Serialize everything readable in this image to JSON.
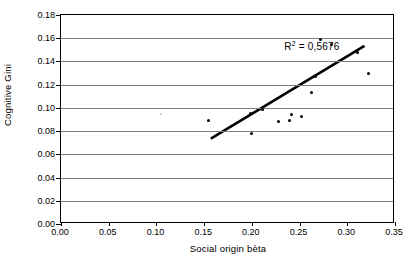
{
  "chart_data": {
    "type": "scatter",
    "title": "",
    "xlabel": "Social origin bèta",
    "ylabel": "Cognitive Gini",
    "xlim": [
      0.0,
      0.35
    ],
    "ylim": [
      0.0,
      0.18
    ],
    "xticks": [
      "0.00",
      "0.05",
      "0.10",
      "0.15",
      "0.20",
      "0.25",
      "0.30",
      "0.35"
    ],
    "xtick_values": [
      0.0,
      0.05,
      0.1,
      0.15,
      0.2,
      0.25,
      0.3,
      0.35
    ],
    "yticks": [
      "0.00",
      "0.02",
      "0.04",
      "0.06",
      "0.08",
      "0.10",
      "0.12",
      "0.14",
      "0.16",
      "0.18"
    ],
    "ytick_values": [
      0.0,
      0.02,
      0.04,
      0.06,
      0.08,
      0.1,
      0.12,
      0.14,
      0.16,
      0.18
    ],
    "grid": "horizontal",
    "legend": "none",
    "annotations": [
      {
        "name": "r-squared",
        "prefix": "R",
        "superscript": "2",
        "equals": "=",
        "value": "0,5676",
        "x": 0.235,
        "y": 0.156
      }
    ],
    "points": [
      {
        "x": 0.105,
        "y": 0.095,
        "style": "faint"
      },
      {
        "x": 0.155,
        "y": 0.089,
        "style": "solid"
      },
      {
        "x": 0.199,
        "y": 0.095,
        "style": "solid"
      },
      {
        "x": 0.2,
        "y": 0.078,
        "style": "solid"
      },
      {
        "x": 0.211,
        "y": 0.099,
        "style": "solid"
      },
      {
        "x": 0.228,
        "y": 0.088,
        "style": "solid"
      },
      {
        "x": 0.239,
        "y": 0.089,
        "style": "solid"
      },
      {
        "x": 0.242,
        "y": 0.094,
        "style": "solid"
      },
      {
        "x": 0.252,
        "y": 0.093,
        "style": "solid"
      },
      {
        "x": 0.262,
        "y": 0.113,
        "style": "solid"
      },
      {
        "x": 0.267,
        "y": 0.127,
        "style": "solid"
      },
      {
        "x": 0.272,
        "y": 0.159,
        "style": "solid"
      },
      {
        "x": 0.283,
        "y": 0.155,
        "style": "solid"
      },
      {
        "x": 0.311,
        "y": 0.148,
        "style": "solid"
      },
      {
        "x": 0.322,
        "y": 0.13,
        "style": "solid"
      }
    ],
    "trendline": {
      "x0": 0.157,
      "y0": 0.0735,
      "x1": 0.318,
      "y1": 0.1535,
      "color": "#000000",
      "width": 2.6
    }
  }
}
